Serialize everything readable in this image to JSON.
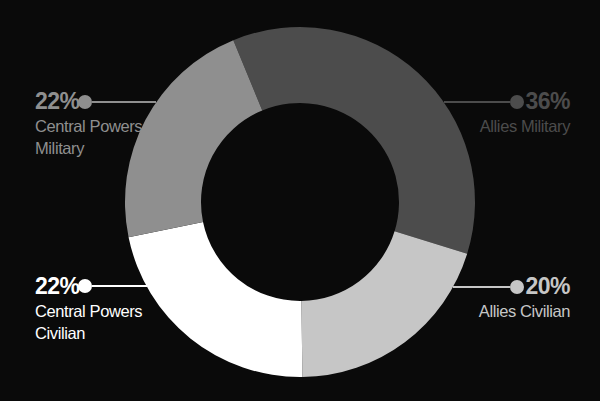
{
  "background": "#0a0a0a",
  "chart_data": {
    "type": "pie",
    "variant": "donut",
    "title": "",
    "legend_position": "callouts",
    "rotation_deg": -22.4,
    "layout": {
      "cx": 300,
      "cy": 202,
      "outer_radius": 175,
      "inner_radius": 99
    },
    "segments": [
      {
        "id": "allies-military",
        "label": "Allies Military",
        "value": 36,
        "value_label": "36%",
        "color": "#4c4c4c",
        "name_lines": [
          "Allies Military"
        ]
      },
      {
        "id": "allies-civilian",
        "label": "Allies Civilian",
        "value": 20,
        "value_label": "20%",
        "color": "#c6c6c6",
        "name_lines": [
          "Allies Civilian"
        ]
      },
      {
        "id": "central-powers-civilian",
        "label": "Central Powers Civilian",
        "value": 22,
        "value_label": "22%",
        "color": "#ffffff",
        "name_lines": [
          "Central Powers",
          "Civilian"
        ]
      },
      {
        "id": "central-powers-military",
        "label": "Central Powers Military",
        "value": 22,
        "value_label": "22%",
        "color": "#8f8f8f",
        "name_lines": [
          "Central Powers",
          "Military"
        ]
      }
    ]
  }
}
